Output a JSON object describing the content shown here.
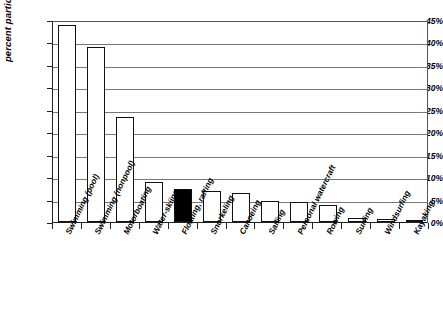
{
  "chart_data": {
    "type": "bar",
    "title": "",
    "xlabel": "",
    "ylabel": "percent participating",
    "ylim": [
      0,
      45
    ],
    "ytick_values": [
      0,
      5,
      10,
      15,
      20,
      25,
      30,
      35,
      40,
      45
    ],
    "ytick_labels": [
      "0%",
      "5%",
      "10%",
      "15%",
      "20%",
      "25%",
      "30%",
      "35%",
      "40%",
      "45%"
    ],
    "grid": true,
    "legend": false,
    "categories": [
      "Swimming (pool)",
      "Swimming (nonpool)",
      "Motorboating",
      "Water-skiing",
      "Floating, rafting",
      "Snorkeling",
      "Canoeing",
      "Sailing",
      "Personal watercraft",
      "Rowing",
      "Surfing",
      "Windsurfing",
      "Kayaking"
    ],
    "values": [
      44.0,
      39.0,
      23.3,
      8.9,
      7.4,
      7.0,
      6.4,
      4.7,
      4.5,
      3.9,
      0.9,
      0.7,
      0.4
    ],
    "highlighted_index": 4,
    "bar_fill_color": "#ffffff",
    "bar_highlight_color": "#000000",
    "bar_edge_color": "#111111",
    "gridline_color": "#777777",
    "axis_color": "#222222"
  }
}
